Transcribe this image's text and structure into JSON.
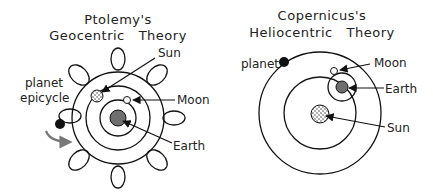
{
  "colors": {
    "background": "#ffffff",
    "line": "#111111",
    "earth": "#6e6e6e",
    "planet": "#111111",
    "arrow_gray": "#777777"
  },
  "left": {
    "title_line1": "Ptolemy's",
    "title_line2": "Geocentric   Theory",
    "labels": {
      "sun": "Sun",
      "moon": "Moon",
      "earth": "Earth",
      "planet": "planet",
      "epicycle": "epicycle"
    }
  },
  "right": {
    "title_line1": "Copernicus's",
    "title_line2": "Heliocentric   Theory",
    "labels": {
      "planet": "planet",
      "moon": "Moon",
      "earth": "Earth",
      "sun": "Sun"
    }
  }
}
